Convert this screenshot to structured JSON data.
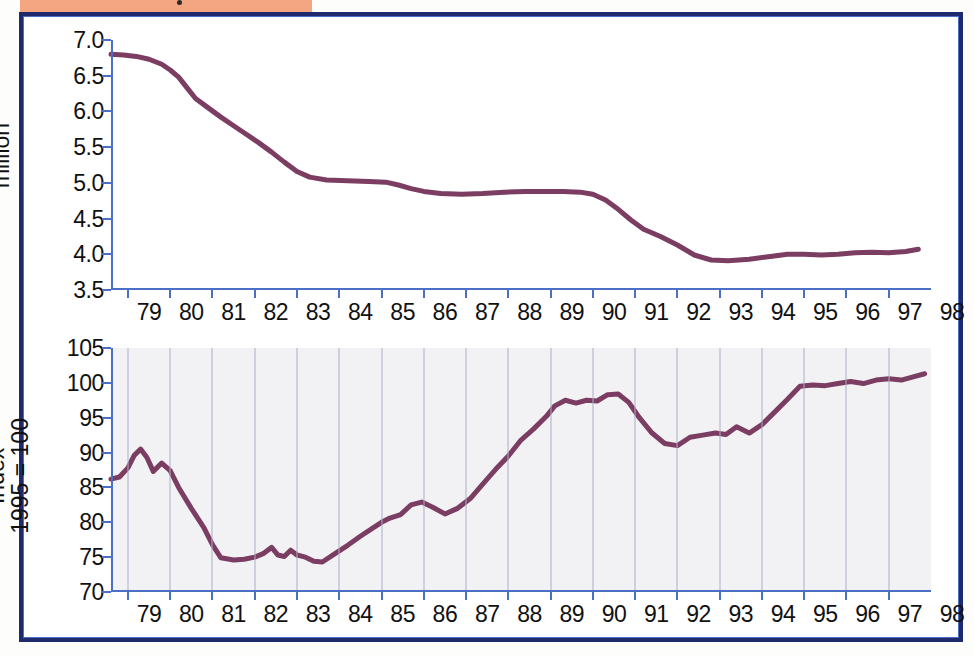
{
  "page": {
    "frame_color": "#1e2a6b",
    "banner_color": "#f4a683",
    "line_color": "#7c3d62",
    "axis_color": "#4b6fc4",
    "grid_color": "#a9aec6",
    "bottom_plot_bg": "#f2f2f5"
  },
  "chart_data": [
    {
      "type": "line",
      "id": "manufacturing-jobs",
      "title": "Manufacturing jobs have shrunk…",
      "xlabel": "",
      "ylabel": "million",
      "ylim": [
        3.5,
        7.0
      ],
      "yticks": [
        "7.0",
        "6.5",
        "6.0",
        "5.5",
        "5.0",
        "4.5",
        "4.0",
        "3.5"
      ],
      "ytick_values": [
        7.0,
        6.5,
        6.0,
        5.5,
        5.0,
        4.5,
        4.0,
        3.5
      ],
      "xlim": [
        1978.6,
        1998.0
      ],
      "categories": [
        "79",
        "80",
        "81",
        "82",
        "83",
        "84",
        "85",
        "86",
        "87",
        "88",
        "89",
        "90",
        "91",
        "92",
        "93",
        "94",
        "95",
        "96",
        "97",
        "98"
      ],
      "grid": false,
      "legend": null,
      "series": [
        {
          "name": "Manufacturing jobs (million)",
          "color": "#7c3d62",
          "x": [
            1978.6,
            1978.9,
            1979.2,
            1979.5,
            1979.8,
            1980.0,
            1980.2,
            1980.4,
            1980.6,
            1980.9,
            1981.2,
            1981.5,
            1981.8,
            1982.1,
            1982.4,
            1982.7,
            1983.0,
            1983.3,
            1983.7,
            1984.2,
            1984.7,
            1985.1,
            1985.4,
            1985.7,
            1986.0,
            1986.4,
            1986.9,
            1987.4,
            1987.9,
            1988.4,
            1988.9,
            1989.3,
            1989.7,
            1990.0,
            1990.3,
            1990.6,
            1990.9,
            1991.2,
            1991.6,
            1992.0,
            1992.4,
            1992.8,
            1993.2,
            1993.7,
            1994.2,
            1994.6,
            1995.0,
            1995.4,
            1995.8,
            1996.2,
            1996.6,
            1997.0,
            1997.4,
            1997.7
          ],
          "y": [
            6.8,
            6.79,
            6.77,
            6.73,
            6.66,
            6.58,
            6.48,
            6.33,
            6.18,
            6.05,
            5.92,
            5.8,
            5.68,
            5.56,
            5.43,
            5.29,
            5.16,
            5.08,
            5.04,
            5.03,
            5.02,
            5.01,
            4.97,
            4.92,
            4.88,
            4.85,
            4.84,
            4.85,
            4.87,
            4.88,
            4.88,
            4.88,
            4.87,
            4.84,
            4.76,
            4.63,
            4.48,
            4.35,
            4.25,
            4.13,
            3.99,
            3.92,
            3.91,
            3.93,
            3.97,
            4.0,
            4.0,
            3.99,
            4.0,
            4.02,
            4.03,
            4.02,
            4.04,
            4.07
          ]
        }
      ]
    },
    {
      "type": "line",
      "id": "manufacturing-output",
      "title": "…even as output has risen",
      "xlabel": "",
      "ylabel": "Index 1995 = 100",
      "ylim": [
        70,
        105
      ],
      "yticks": [
        "105",
        "100",
        "95",
        "90",
        "85",
        "80",
        "75",
        "70"
      ],
      "ytick_values": [
        105,
        100,
        95,
        90,
        85,
        80,
        75,
        70
      ],
      "xlim": [
        1978.6,
        1998.0
      ],
      "categories": [
        "79",
        "80",
        "81",
        "82",
        "83",
        "84",
        "85",
        "86",
        "87",
        "88",
        "89",
        "90",
        "91",
        "92",
        "93",
        "94",
        "95",
        "96",
        "97",
        "98"
      ],
      "grid": true,
      "legend": null,
      "series": [
        {
          "name": "Output index (1995 = 100)",
          "color": "#7c3d62",
          "x": [
            1978.6,
            1978.8,
            1979.0,
            1979.15,
            1979.3,
            1979.45,
            1979.6,
            1979.8,
            1980.0,
            1980.2,
            1980.5,
            1980.8,
            1981.0,
            1981.2,
            1981.5,
            1981.75,
            1982.0,
            1982.2,
            1982.4,
            1982.55,
            1982.7,
            1982.85,
            1983.0,
            1983.2,
            1983.4,
            1983.6,
            1983.9,
            1984.2,
            1984.5,
            1984.8,
            1985.0,
            1985.2,
            1985.45,
            1985.7,
            1985.95,
            1986.2,
            1986.5,
            1986.8,
            1987.1,
            1987.4,
            1987.7,
            1988.0,
            1988.3,
            1988.6,
            1988.9,
            1989.1,
            1989.35,
            1989.6,
            1989.85,
            1990.1,
            1990.35,
            1990.6,
            1990.85,
            1991.1,
            1991.4,
            1991.7,
            1992.0,
            1992.3,
            1992.6,
            1992.9,
            1993.15,
            1993.4,
            1993.7,
            1994.0,
            1994.3,
            1994.6,
            1994.9,
            1995.2,
            1995.5,
            1995.8,
            1996.1,
            1996.4,
            1996.7,
            1997.0,
            1997.3,
            1997.6,
            1997.85
          ],
          "y": [
            86.2,
            86.5,
            87.8,
            89.6,
            90.5,
            89.3,
            87.3,
            88.5,
            87.4,
            85.0,
            82.0,
            79.2,
            76.8,
            74.9,
            74.6,
            74.7,
            75.0,
            75.5,
            76.4,
            75.3,
            75.1,
            76.0,
            75.3,
            75.0,
            74.4,
            74.3,
            75.5,
            76.7,
            78.0,
            79.2,
            80.0,
            80.6,
            81.1,
            82.5,
            82.9,
            82.2,
            81.2,
            82.0,
            83.4,
            85.5,
            87.6,
            89.5,
            91.8,
            93.4,
            95.2,
            96.7,
            97.5,
            97.1,
            97.5,
            97.4,
            98.3,
            98.4,
            97.2,
            95.0,
            92.8,
            91.3,
            91.0,
            92.2,
            92.5,
            92.8,
            92.6,
            93.7,
            92.8,
            94.0,
            95.8,
            97.6,
            99.5,
            99.7,
            99.6,
            99.9,
            100.2,
            99.9,
            100.4,
            100.6,
            100.4,
            100.9,
            101.3
          ]
        }
      ]
    }
  ]
}
